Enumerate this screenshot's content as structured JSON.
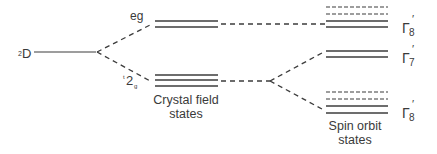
{
  "diagram": {
    "labels": {
      "term": {
        "superscript": "2",
        "main": "D"
      },
      "eg": "eg",
      "t2g": {
        "superscript": "t",
        "main": "2",
        "subscript": "g"
      },
      "crystal_field_line1": "Crystal field",
      "crystal_field_line2": "states",
      "spin_orbit_line1": "Spin orbit",
      "spin_orbit_line2": "states",
      "gamma8_top": {
        "symbol": "Γ",
        "subscript": "8",
        "prime": "′"
      },
      "gamma7": {
        "symbol": "Γ",
        "subscript": "7",
        "prime": "′"
      },
      "gamma8_bottom": {
        "symbol": "Γ",
        "subscript": "8",
        "prime": "′"
      }
    },
    "levels": {
      "free_ion": {
        "name": "2D",
        "y": 52
      },
      "crystal_field": [
        {
          "name": "eg",
          "lines": 2,
          "ys": [
            21,
            27
          ]
        },
        {
          "name": "t2g",
          "lines": 3,
          "ys": [
            75,
            80,
            86
          ]
        }
      ],
      "spin_orbit": [
        {
          "name": "Γ8′ (upper)",
          "dashed_ys": [
            7,
            14
          ],
          "solid_ys": [
            21,
            27
          ]
        },
        {
          "name": "Γ7′",
          "dashed_ys": [],
          "solid_ys": [
            51,
            57
          ]
        },
        {
          "name": "Γ8′ (lower)",
          "dashed_ys": [
            92,
            99
          ],
          "solid_ys": [
            106,
            113
          ]
        }
      ]
    },
    "colors": {
      "line": "#3c3c3c",
      "text": "#3a3a3a",
      "background": "#ffffff"
    }
  }
}
